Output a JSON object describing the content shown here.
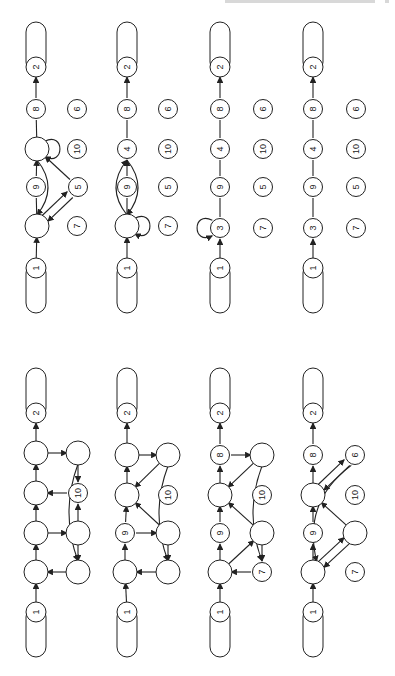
{
  "page": {
    "orientation": "rotated-90-clockwise",
    "background": "#ffffff",
    "ink": "#222222"
  },
  "node_radius": 11,
  "diagrams": [
    {
      "id": "top-1",
      "title": "reduction-step-a",
      "source": {
        "label": "1",
        "x": 36,
        "y": 268
      },
      "sink": {
        "label": "2",
        "x": 36,
        "y": 67
      },
      "nodes": [
        {
          "id": "b",
          "label": "",
          "x": 37,
          "y": 149
        },
        {
          "id": "n10",
          "label": "10",
          "x": 77,
          "y": 149
        },
        {
          "id": "n9",
          "label": "9",
          "x": 36,
          "y": 187
        },
        {
          "id": "n5",
          "label": "5",
          "x": 78,
          "y": 187
        },
        {
          "id": "a",
          "label": "",
          "x": 37,
          "y": 226
        },
        {
          "id": "n7",
          "label": "7",
          "x": 77,
          "y": 226
        },
        {
          "id": "n8",
          "label": "8",
          "x": 36,
          "y": 109
        },
        {
          "id": "n6",
          "label": "6",
          "x": 77,
          "y": 109
        }
      ],
      "edges": [
        {
          "from": "src",
          "to": "a"
        },
        {
          "from": "a",
          "to": "n9",
          "arrow": false
        },
        {
          "from": "n9",
          "to": "b"
        },
        {
          "from": "b",
          "to": "n8",
          "arrow": false
        },
        {
          "from": "n8",
          "to": "sink"
        },
        {
          "from": "a",
          "to": "n5",
          "offset": -2
        },
        {
          "from": "n5",
          "to": "a",
          "offset": -2
        },
        {
          "from": "n5",
          "to": "b"
        },
        {
          "from": "b",
          "to": "a",
          "curve": -22
        },
        {
          "from": "b",
          "to": "b",
          "loop": "right"
        }
      ]
    },
    {
      "id": "top-2",
      "title": "reduction-step-b",
      "source": {
        "label": "1",
        "x": 127,
        "y": 268
      },
      "sink": {
        "label": "2",
        "x": 127,
        "y": 67
      },
      "nodes": [
        {
          "id": "n4",
          "label": "4",
          "x": 127,
          "y": 149
        },
        {
          "id": "n10",
          "label": "10",
          "x": 168,
          "y": 149
        },
        {
          "id": "n9",
          "label": "9",
          "x": 127,
          "y": 187
        },
        {
          "id": "n5",
          "label": "5",
          "x": 168,
          "y": 187
        },
        {
          "id": "a",
          "label": "",
          "x": 127,
          "y": 226
        },
        {
          "id": "n7",
          "label": "7",
          "x": 168,
          "y": 226
        },
        {
          "id": "n8",
          "label": "8",
          "x": 127,
          "y": 109
        },
        {
          "id": "n6",
          "label": "6",
          "x": 168,
          "y": 109
        }
      ],
      "edges": [
        {
          "from": "src",
          "to": "a"
        },
        {
          "from": "a",
          "to": "n9",
          "arrow": false
        },
        {
          "from": "n9",
          "to": "n4"
        },
        {
          "from": "n4",
          "to": "n8",
          "arrow": false
        },
        {
          "from": "n8",
          "to": "sink"
        },
        {
          "from": "n4",
          "to": "a",
          "curve": -22
        },
        {
          "from": "a",
          "to": "n4",
          "curve": -22
        },
        {
          "from": "a",
          "to": "a",
          "loop": "right"
        }
      ]
    },
    {
      "id": "top-3",
      "title": "reduction-step-c",
      "source": {
        "label": "1",
        "x": 220,
        "y": 268
      },
      "sink": {
        "label": "2",
        "x": 220,
        "y": 67
      },
      "nodes": [
        {
          "id": "n4",
          "label": "4",
          "x": 220,
          "y": 149
        },
        {
          "id": "n10",
          "label": "10",
          "x": 263,
          "y": 149
        },
        {
          "id": "n9",
          "label": "9",
          "x": 220,
          "y": 187
        },
        {
          "id": "n5",
          "label": "5",
          "x": 263,
          "y": 187
        },
        {
          "id": "n3",
          "label": "3",
          "x": 220,
          "y": 228
        },
        {
          "id": "n7",
          "label": "7",
          "x": 263,
          "y": 228
        },
        {
          "id": "n8",
          "label": "8",
          "x": 220,
          "y": 109
        },
        {
          "id": "n6",
          "label": "6",
          "x": 263,
          "y": 109
        }
      ],
      "edges": [
        {
          "from": "src",
          "to": "n3"
        },
        {
          "from": "n3",
          "to": "n9",
          "arrow": false
        },
        {
          "from": "n9",
          "to": "n4",
          "arrow": false
        },
        {
          "from": "n4",
          "to": "n8",
          "arrow": false
        },
        {
          "from": "n8",
          "to": "sink"
        },
        {
          "from": "n3",
          "to": "n3",
          "loop": "left"
        }
      ]
    },
    {
      "id": "top-4",
      "title": "reduction-step-d",
      "source": {
        "label": "1",
        "x": 313,
        "y": 268
      },
      "sink": {
        "label": "2",
        "x": 313,
        "y": 67
      },
      "nodes": [
        {
          "id": "n4",
          "label": "4",
          "x": 313,
          "y": 149
        },
        {
          "id": "n10",
          "label": "10",
          "x": 356,
          "y": 149
        },
        {
          "id": "n9",
          "label": "9",
          "x": 313,
          "y": 187
        },
        {
          "id": "n5",
          "label": "5",
          "x": 356,
          "y": 187
        },
        {
          "id": "n3",
          "label": "3",
          "x": 313,
          "y": 228
        },
        {
          "id": "n7",
          "label": "7",
          "x": 356,
          "y": 228
        },
        {
          "id": "n8",
          "label": "8",
          "x": 313,
          "y": 109
        },
        {
          "id": "n6",
          "label": "6",
          "x": 356,
          "y": 109
        }
      ],
      "edges": [
        {
          "from": "src",
          "to": "n3"
        },
        {
          "from": "n3",
          "to": "n9",
          "arrow": false
        },
        {
          "from": "n9",
          "to": "n4",
          "arrow": false
        },
        {
          "from": "n4",
          "to": "n8",
          "arrow": false
        },
        {
          "from": "n8",
          "to": "sink"
        }
      ]
    },
    {
      "id": "bottom-1",
      "title": "original-graph",
      "source": {
        "label": "1",
        "x": 36,
        "y": 612
      },
      "sink": {
        "label": "2",
        "x": 36,
        "y": 413
      },
      "nodes": [
        {
          "id": "s1",
          "label": "",
          "x": 36,
          "y": 453
        },
        {
          "id": "r1",
          "label": "",
          "x": 78,
          "y": 453
        },
        {
          "id": "s2",
          "label": "",
          "x": 36,
          "y": 493
        },
        {
          "id": "n10",
          "label": "10",
          "x": 78,
          "y": 493
        },
        {
          "id": "s3",
          "label": "",
          "x": 36,
          "y": 533
        },
        {
          "id": "r3",
          "label": "",
          "x": 78,
          "y": 533
        },
        {
          "id": "s4",
          "label": "",
          "x": 36,
          "y": 572
        },
        {
          "id": "r4",
          "label": "",
          "x": 78,
          "y": 572
        }
      ],
      "edges": [
        {
          "from": "src",
          "to": "s4"
        },
        {
          "from": "s4",
          "to": "s3"
        },
        {
          "from": "s3",
          "to": "s2"
        },
        {
          "from": "s2",
          "to": "s1"
        },
        {
          "from": "s1",
          "to": "sink"
        },
        {
          "from": "s1",
          "to": "r1"
        },
        {
          "from": "r1",
          "to": "n10"
        },
        {
          "from": "n10",
          "to": "s2"
        },
        {
          "from": "s3",
          "to": "r3"
        },
        {
          "from": "r3",
          "to": "n10"
        },
        {
          "from": "r3",
          "to": "r4"
        },
        {
          "from": "r4",
          "to": "s4"
        },
        {
          "from": "r1",
          "to": "r4",
          "curve": 18
        }
      ]
    },
    {
      "id": "bottom-2",
      "title": "reduction-step-1",
      "source": {
        "label": "1",
        "x": 127,
        "y": 612
      },
      "sink": {
        "label": "2",
        "x": 127,
        "y": 413
      },
      "nodes": [
        {
          "id": "s1",
          "label": "",
          "x": 127,
          "y": 455
        },
        {
          "id": "r1",
          "label": "",
          "x": 168,
          "y": 455
        },
        {
          "id": "s2",
          "label": "",
          "x": 127,
          "y": 495
        },
        {
          "id": "n10",
          "label": "10",
          "x": 168,
          "y": 495
        },
        {
          "id": "n9",
          "label": "9",
          "x": 125,
          "y": 533
        },
        {
          "id": "r3",
          "label": "",
          "x": 168,
          "y": 533
        },
        {
          "id": "s4",
          "label": "",
          "x": 125,
          "y": 572
        },
        {
          "id": "r4",
          "label": "",
          "x": 168,
          "y": 572
        }
      ],
      "edges": [
        {
          "from": "src",
          "to": "s4"
        },
        {
          "from": "s4",
          "to": "n9"
        },
        {
          "from": "n9",
          "to": "s2"
        },
        {
          "from": "s2",
          "to": "s1"
        },
        {
          "from": "s1",
          "to": "sink"
        },
        {
          "from": "s1",
          "to": "r1"
        },
        {
          "from": "r1",
          "to": "s2"
        },
        {
          "from": "n9",
          "to": "r3"
        },
        {
          "from": "r3",
          "to": "s2"
        },
        {
          "from": "r3",
          "to": "r4"
        },
        {
          "from": "r4",
          "to": "s4"
        },
        {
          "from": "r1",
          "to": "r4",
          "curve": 18
        }
      ]
    },
    {
      "id": "bottom-3",
      "title": "reduction-step-2",
      "source": {
        "label": "1",
        "x": 220,
        "y": 612
      },
      "sink": {
        "label": "2",
        "x": 220,
        "y": 413
      },
      "nodes": [
        {
          "id": "n8",
          "label": "8",
          "x": 220,
          "y": 455
        },
        {
          "id": "r1",
          "label": "",
          "x": 262,
          "y": 455
        },
        {
          "id": "s2",
          "label": "",
          "x": 220,
          "y": 495
        },
        {
          "id": "n10",
          "label": "10",
          "x": 262,
          "y": 495
        },
        {
          "id": "n9",
          "label": "9",
          "x": 220,
          "y": 533
        },
        {
          "id": "r3",
          "label": "",
          "x": 262,
          "y": 533
        },
        {
          "id": "s4",
          "label": "",
          "x": 220,
          "y": 572
        },
        {
          "id": "n7",
          "label": "7",
          "x": 262,
          "y": 572
        }
      ],
      "edges": [
        {
          "from": "src",
          "to": "s4"
        },
        {
          "from": "s4",
          "to": "n9"
        },
        {
          "from": "n9",
          "to": "s2"
        },
        {
          "from": "s2",
          "to": "n8"
        },
        {
          "from": "n8",
          "to": "sink"
        },
        {
          "from": "n8",
          "to": "r1"
        },
        {
          "from": "r1",
          "to": "s2"
        },
        {
          "from": "s4",
          "to": "r3"
        },
        {
          "from": "r3",
          "to": "s2"
        },
        {
          "from": "r3",
          "to": "n7"
        },
        {
          "from": "n7",
          "to": "s4"
        },
        {
          "from": "r1",
          "to": "n7",
          "curve": 18
        }
      ]
    },
    {
      "id": "bottom-4",
      "title": "reduction-step-3",
      "source": {
        "label": "1",
        "x": 313,
        "y": 612
      },
      "sink": {
        "label": "2",
        "x": 313,
        "y": 413
      },
      "nodes": [
        {
          "id": "n8",
          "label": "8",
          "x": 313,
          "y": 455
        },
        {
          "id": "n6",
          "label": "6",
          "x": 355,
          "y": 455
        },
        {
          "id": "s2",
          "label": "",
          "x": 313,
          "y": 495
        },
        {
          "id": "n10",
          "label": "10",
          "x": 355,
          "y": 495
        },
        {
          "id": "n9",
          "label": "9",
          "x": 313,
          "y": 533
        },
        {
          "id": "r3",
          "label": "",
          "x": 355,
          "y": 533
        },
        {
          "id": "s4",
          "label": "",
          "x": 313,
          "y": 572
        },
        {
          "id": "n7",
          "label": "7",
          "x": 355,
          "y": 572
        }
      ],
      "edges": [
        {
          "from": "src",
          "to": "s4"
        },
        {
          "from": "s4",
          "to": "n9"
        },
        {
          "from": "n9",
          "to": "s2"
        },
        {
          "from": "s2",
          "to": "n8"
        },
        {
          "from": "n8",
          "to": "sink"
        },
        {
          "from": "s2",
          "to": "n6",
          "offset": -2
        },
        {
          "from": "n6",
          "to": "s2",
          "offset": -2
        },
        {
          "from": "s4",
          "to": "r3",
          "offset": -2
        },
        {
          "from": "r3",
          "to": "s4",
          "offset": -2
        },
        {
          "from": "r3",
          "to": "s2"
        },
        {
          "from": "n6",
          "to": "s4",
          "curve": 34
        }
      ]
    }
  ]
}
